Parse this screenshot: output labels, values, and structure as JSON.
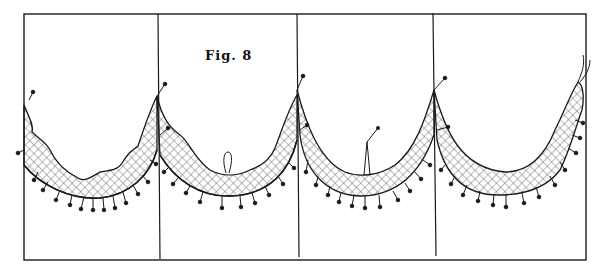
{
  "figure": {
    "caption": "Fig. 8",
    "panel_count": 4,
    "colors": {
      "line": "#1a1a1a",
      "background": "#ffffff",
      "hatch": "#555555"
    }
  }
}
